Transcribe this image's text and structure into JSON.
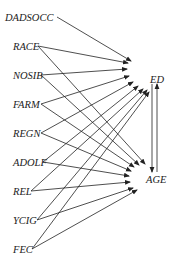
{
  "diagram": {
    "type": "path-diagram",
    "sources": [
      {
        "id": "DADSOCC",
        "label": "DADSOCC",
        "x": 5,
        "y": 17,
        "ax": 57,
        "ay": 17
      },
      {
        "id": "RACE",
        "label": "RACE",
        "x": 13,
        "y": 46,
        "ax": 38,
        "ay": 46
      },
      {
        "id": "NOSIB",
        "label": "NOSIB",
        "x": 13,
        "y": 75,
        "ax": 41,
        "ay": 75
      },
      {
        "id": "FARM",
        "label": "FARM",
        "x": 13,
        "y": 104,
        "ax": 41,
        "ay": 104
      },
      {
        "id": "REGN",
        "label": "REGN",
        "x": 13,
        "y": 133,
        "ax": 41,
        "ay": 133
      },
      {
        "id": "ADOLF",
        "label": "ADOLF",
        "x": 13,
        "y": 162,
        "ax": 43,
        "ay": 162
      },
      {
        "id": "REL",
        "label": "REL",
        "x": 13,
        "y": 191,
        "ax": 31,
        "ay": 191
      },
      {
        "id": "YCIG",
        "label": "YCIG",
        "x": 13,
        "y": 220,
        "ax": 37,
        "ay": 220
      },
      {
        "id": "FEC",
        "label": "FEC",
        "x": 13,
        "y": 249,
        "ax": 32,
        "ay": 249
      }
    ],
    "targets": [
      {
        "id": "ED",
        "label": "ED",
        "x": 150,
        "y": 79
      },
      {
        "id": "AGE",
        "label": "AGE",
        "x": 146,
        "y": 179
      }
    ],
    "edges_to_ED": [
      {
        "from": "DADSOCC",
        "tx": 131,
        "ty": 61
      },
      {
        "from": "RACE",
        "tx": 128,
        "ty": 63
      },
      {
        "from": "NOSIB",
        "tx": 127,
        "ty": 69
      },
      {
        "from": "FARM",
        "tx": 129,
        "ty": 76
      },
      {
        "from": "REGN",
        "tx": 133,
        "ty": 82
      },
      {
        "from": "ADOLF",
        "tx": 138,
        "ty": 86
      },
      {
        "from": "REL",
        "tx": 143,
        "ty": 89
      },
      {
        "from": "YCIG",
        "tx": 147,
        "ty": 90
      },
      {
        "from": "FEC",
        "tx": 149,
        "ty": 92
      }
    ],
    "edges_to_AGE": [
      {
        "from": "RACE",
        "tx": 145,
        "ty": 164
      },
      {
        "from": "NOSIB",
        "tx": 139,
        "ty": 165
      },
      {
        "from": "FARM",
        "tx": 134,
        "ty": 167
      },
      {
        "from": "REGN",
        "tx": 131,
        "ty": 171
      },
      {
        "from": "ADOLF",
        "tx": 129,
        "ty": 176
      },
      {
        "from": "REL",
        "tx": 130,
        "ty": 182
      },
      {
        "from": "YCIG",
        "tx": 133,
        "ty": 188
      },
      {
        "from": "FEC",
        "tx": 137,
        "ty": 190
      }
    ],
    "bidirectional": {
      "between": [
        "ED",
        "AGE"
      ],
      "down_x": 152,
      "up_x": 157,
      "top_y": 84,
      "bottom_y": 172
    }
  }
}
